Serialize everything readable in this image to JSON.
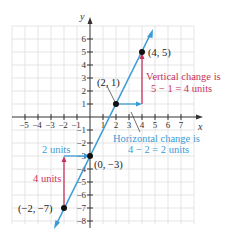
{
  "figure": {
    "x_axis_label": "x",
    "y_axis_label": "y",
    "x_ticks": [
      "−5",
      "−4",
      "−3",
      "−2",
      "−1",
      "1",
      "2",
      "3",
      "4",
      "5",
      "6",
      "7"
    ],
    "y_ticks_pos": [
      "1",
      "2",
      "3",
      "4",
      "5",
      "6"
    ],
    "y_ticks_neg": [
      "−1",
      "−2",
      "−3",
      "−4",
      "−5",
      "−6",
      "−7",
      "−8"
    ],
    "points": {
      "p1": "(4, 5)",
      "p2": "(2, 1)",
      "p3": "(0, −3)",
      "p4": "(−2, −7)"
    },
    "annotations": {
      "vertical_line1": "Vertical change is",
      "vertical_line2": "5 − 1 = 4 units",
      "horizontal_line1": "Horizontal change is",
      "horizontal_line2": "4 − 2 = 2 units",
      "two_units": "2 units",
      "four_units": "4 units"
    },
    "colors": {
      "line": "#3a9bd5",
      "vertical_arrow": "#c8325a",
      "horizontal_arrow": "#3a9bd5",
      "grid": "#dcdcdc",
      "axis": "#333333"
    }
  }
}
